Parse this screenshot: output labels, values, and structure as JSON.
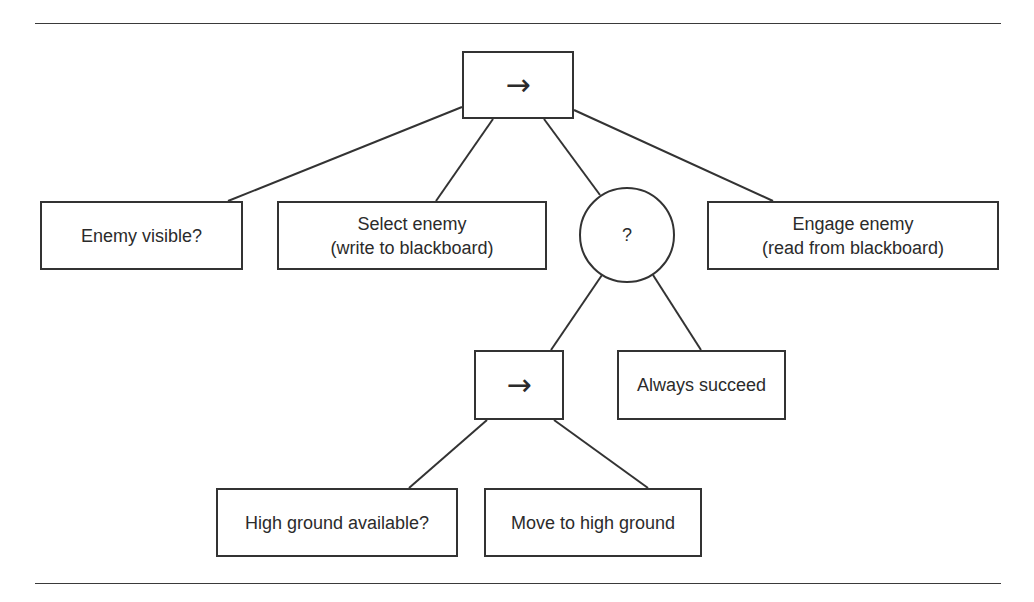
{
  "diagram": {
    "type": "behavior-tree",
    "nodes": [
      {
        "id": "root_sequence",
        "kind": "sequence",
        "label": "→",
        "x": 462,
        "y": 51,
        "w": 112,
        "h": 68,
        "shape": "rect"
      },
      {
        "id": "enemy_visible",
        "kind": "condition",
        "label": "Enemy visible?",
        "x": 40,
        "y": 201,
        "w": 203,
        "h": 69,
        "shape": "rect"
      },
      {
        "id": "select_enemy",
        "kind": "action",
        "label": "Select enemy\n(write to blackboard)",
        "x": 277,
        "y": 201,
        "w": 270,
        "h": 69,
        "shape": "rect"
      },
      {
        "id": "selector",
        "kind": "selector",
        "label": "?",
        "x": 579,
        "y": 187,
        "w": 96,
        "h": 96,
        "shape": "circle"
      },
      {
        "id": "engage_enemy",
        "kind": "action",
        "label": "Engage enemy\n(read from blackboard)",
        "x": 707,
        "y": 201,
        "w": 292,
        "h": 69,
        "shape": "rect"
      },
      {
        "id": "sub_sequence",
        "kind": "sequence",
        "label": "→",
        "x": 474,
        "y": 350,
        "w": 90,
        "h": 70,
        "shape": "rect"
      },
      {
        "id": "always_succeed",
        "kind": "decorator",
        "label": "Always succeed",
        "x": 617,
        "y": 350,
        "w": 169,
        "h": 70,
        "shape": "rect"
      },
      {
        "id": "high_ground_available",
        "kind": "condition",
        "label": "High ground available?",
        "x": 216,
        "y": 488,
        "w": 242,
        "h": 69,
        "shape": "rect"
      },
      {
        "id": "move_to_high_ground",
        "kind": "action",
        "label": "Move to high ground",
        "x": 484,
        "y": 488,
        "w": 218,
        "h": 69,
        "shape": "rect"
      }
    ],
    "edges": [
      {
        "from": "root_sequence",
        "to": "enemy_visible",
        "x1": 462,
        "y1": 107,
        "x2": 228,
        "y2": 201
      },
      {
        "from": "root_sequence",
        "to": "select_enemy",
        "x1": 493,
        "y1": 119,
        "x2": 436,
        "y2": 201
      },
      {
        "from": "root_sequence",
        "to": "selector",
        "x1": 544,
        "y1": 119,
        "x2": 600,
        "y2": 195
      },
      {
        "from": "root_sequence",
        "to": "engage_enemy",
        "x1": 574,
        "y1": 110,
        "x2": 773,
        "y2": 201
      },
      {
        "from": "selector",
        "to": "sub_sequence",
        "x1": 602,
        "y1": 275,
        "x2": 551,
        "y2": 350
      },
      {
        "from": "selector",
        "to": "always_succeed",
        "x1": 653,
        "y1": 275,
        "x2": 701,
        "y2": 350
      },
      {
        "from": "sub_sequence",
        "to": "high_ground_available",
        "x1": 487,
        "y1": 420,
        "x2": 409,
        "y2": 488
      },
      {
        "from": "sub_sequence",
        "to": "move_to_high_ground",
        "x1": 554,
        "y1": 420,
        "x2": 648,
        "y2": 488
      }
    ]
  },
  "colors": {
    "stroke": "#333333",
    "text": "#2b2b2b",
    "background": "#ffffff"
  }
}
